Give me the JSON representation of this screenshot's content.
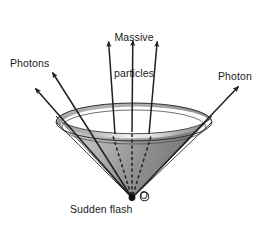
{
  "figure": {
    "background_color": "#ffffff",
    "ink_color": "#1a1a1a",
    "labels": {
      "massive_particles_line1": "Massive",
      "massive_particles_line2": "particles",
      "photons_left": "Photons",
      "photon_right": "Photon",
      "sudden_flash": "Sudden flash",
      "origin_point": "O"
    }
  },
  "diagram_data": {
    "type": "physics-spacetime-light-cone",
    "origin": {
      "x": 132,
      "y": 198,
      "label": "O",
      "marker": "filled-dot"
    },
    "cone": {
      "rim_ellipse": {
        "cx": 134,
        "cy": 122,
        "rx": 78,
        "ry": 19
      },
      "inner_rim_ellipse": {
        "cx": 134,
        "cy": 127,
        "rx": 72,
        "ry": 17
      },
      "apex": {
        "x": 132,
        "y": 198
      },
      "outer_fill": "#8a8a8a",
      "inner_fill": "#6e6e6e",
      "highlight_fill": "#e8e8e8",
      "stroke": "#2b2b2b"
    },
    "worldlines": [
      {
        "name": "photon-left-outer",
        "kind": "photon",
        "style": "solid-arrow",
        "from": {
          "x": 132,
          "y": 198
        },
        "to": {
          "x": 33,
          "y": 86
        }
      },
      {
        "name": "photon-left-inner",
        "kind": "photon",
        "style": "solid-arrow",
        "from": {
          "x": 132,
          "y": 198
        },
        "to": {
          "x": 50,
          "y": 70
        }
      },
      {
        "name": "photon-right",
        "kind": "photon",
        "style": "solid-arrow",
        "from": {
          "x": 132,
          "y": 198
        },
        "to": {
          "x": 241,
          "y": 84
        }
      },
      {
        "name": "massive-particle-left",
        "kind": "massive",
        "style": "solid-arrow",
        "from": {
          "x": 132,
          "y": 198
        },
        "to": {
          "x": 108,
          "y": 40
        }
      },
      {
        "name": "massive-particle-center",
        "kind": "massive",
        "style": "solid-arrow",
        "from": {
          "x": 132,
          "y": 198
        },
        "to": {
          "x": 133,
          "y": 39
        }
      },
      {
        "name": "massive-particle-right",
        "kind": "massive",
        "style": "solid-arrow",
        "from": {
          "x": 132,
          "y": 198
        },
        "to": {
          "x": 158,
          "y": 40
        }
      }
    ],
    "hidden_segments": [
      {
        "name": "massive-particle-left-hidden",
        "style": "dashed",
        "from": {
          "x": 132,
          "y": 196
        },
        "to": {
          "x": 113,
          "y": 139
        }
      },
      {
        "name": "massive-particle-center-hidden",
        "style": "dashed",
        "from": {
          "x": 132,
          "y": 196
        },
        "to": {
          "x": 132,
          "y": 138
        }
      },
      {
        "name": "massive-particle-right-hidden",
        "style": "dashed",
        "from": {
          "x": 132,
          "y": 196
        },
        "to": {
          "x": 151,
          "y": 139
        }
      }
    ],
    "annotations": [
      {
        "name": "massive-particles-annotation",
        "text": "Massive particles",
        "points_to": "massive-particle-center"
      },
      {
        "name": "photons-left-annotation",
        "text": "Photons",
        "points_to": "photon-left-inner"
      },
      {
        "name": "photon-right-annotation",
        "text": "Photon",
        "points_to": "photon-right"
      },
      {
        "name": "sudden-flash-annotation",
        "text": "Sudden flash",
        "points_to": "origin"
      }
    ]
  }
}
